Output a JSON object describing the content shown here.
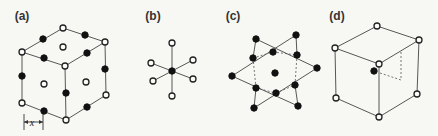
{
  "figure": {
    "panels": [
      {
        "label": "(a)",
        "label_pos": [
          22,
          16
        ],
        "description": "cube with open atoms at corners and face centers, filled atoms at edge midpoints",
        "edges": [
          [
            63,
            28,
            105,
            42
          ],
          [
            105,
            42,
            65,
            66
          ],
          [
            65,
            66,
            22,
            52
          ],
          [
            22,
            52,
            63,
            28
          ],
          [
            22,
            52,
            22,
            103
          ],
          [
            65,
            66,
            66,
            120
          ],
          [
            105,
            42,
            106,
            95
          ],
          [
            22,
            103,
            66,
            120
          ],
          [
            66,
            120,
            106,
            95
          ]
        ],
        "open_atoms": [
          [
            63,
            28
          ],
          [
            22,
            52
          ],
          [
            105,
            42
          ],
          [
            65,
            66
          ],
          [
            22,
            103
          ],
          [
            66,
            120
          ],
          [
            106,
            95
          ],
          [
            63,
            47
          ],
          [
            44,
            84
          ],
          [
            86,
            82
          ]
        ],
        "filled_atoms": [
          [
            43,
            39
          ],
          [
            85,
            35
          ],
          [
            44,
            58
          ],
          [
            87,
            53
          ],
          [
            22,
            76
          ],
          [
            66,
            93
          ],
          [
            105,
            69
          ],
          [
            44,
            111
          ],
          [
            87,
            107
          ]
        ],
        "measure": {
          "x1": 24,
          "x2": 43,
          "y": 122,
          "tick_top": 114,
          "tick_bottom": 130,
          "label": "x",
          "label_pos": [
            32,
            126
          ]
        }
      },
      {
        "label": "(b)",
        "label_pos": [
          153,
          16
        ],
        "description": "octahedral coordination: central filled atom with six open neighbours",
        "center": [
          172,
          71
        ],
        "center_filled": true,
        "neighbors": [
          [
            172,
            43
          ],
          [
            172,
            96
          ],
          [
            151,
            63
          ],
          [
            193,
            60
          ],
          [
            153,
            81
          ],
          [
            193,
            79
          ]
        ]
      },
      {
        "label": "(c)",
        "label_pos": [
          233,
          16
        ],
        "description": "two interpenetrating triangles (hexagram) with filled atoms",
        "edges": [
          [
            256,
            39,
            317,
            68
          ],
          [
            317,
            68,
            254,
            108
          ],
          [
            296,
            35,
            232,
            76
          ],
          [
            232,
            76,
            298,
            106
          ],
          [
            296,
            35,
            297,
            55
          ],
          [
            256,
            88,
            254,
            108
          ],
          [
            295,
            85,
            298,
            106
          ],
          [
            256,
            39,
            253,
            58
          ]
        ],
        "dashed_edges": [
          [
            253,
            58,
            256,
            88
          ],
          [
            297,
            55,
            295,
            85
          ],
          [
            253,
            58,
            273,
            52
          ],
          [
            273,
            52,
            297,
            55
          ],
          [
            256,
            88,
            276,
            93
          ],
          [
            276,
            93,
            295,
            85
          ]
        ],
        "filled_atoms": [
          [
            256,
            39
          ],
          [
            296,
            35
          ],
          [
            253,
            58
          ],
          [
            273,
            52
          ],
          [
            297,
            55
          ],
          [
            232,
            76
          ],
          [
            275,
            73
          ],
          [
            317,
            68
          ],
          [
            256,
            88
          ],
          [
            295,
            85
          ],
          [
            276,
            93
          ],
          [
            254,
            108
          ],
          [
            298,
            106
          ]
        ]
      },
      {
        "label": "(d)",
        "label_pos": [
          337,
          16
        ],
        "description": "cube with open corner atoms and one filled interstitial atom",
        "edges": [
          [
            377,
            26,
            419,
            40
          ],
          [
            419,
            40,
            379,
            64
          ],
          [
            379,
            64,
            335,
            48
          ],
          [
            335,
            48,
            377,
            26
          ],
          [
            335,
            48,
            336,
            98
          ],
          [
            379,
            64,
            379,
            117
          ],
          [
            419,
            40,
            417,
            94
          ],
          [
            336,
            98,
            379,
            117
          ],
          [
            379,
            117,
            417,
            94
          ]
        ],
        "dashed_edges": [
          [
            401,
            52,
            401,
            80
          ],
          [
            380,
            73,
            401,
            80
          ]
        ],
        "open_atoms": [
          [
            377,
            26
          ],
          [
            335,
            48
          ],
          [
            419,
            40
          ],
          [
            379,
            64
          ],
          [
            336,
            98
          ],
          [
            379,
            117
          ],
          [
            417,
            94
          ]
        ],
        "filled_atoms": [
          [
            374,
            71
          ]
        ]
      }
    ],
    "colors": {
      "background": "#f7f7f4",
      "line": "#444444",
      "atom_fill_filled": "#111111",
      "atom_fill_open": "#fbfbf9"
    }
  }
}
